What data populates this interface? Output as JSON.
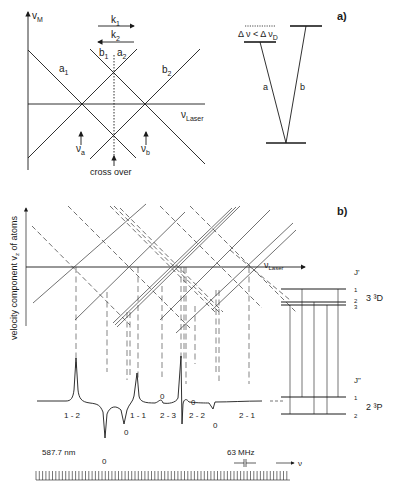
{
  "panel_a": {
    "label": "a)",
    "diagram": {
      "y_axis": "v",
      "y_axis_sub": "M",
      "x_axis": "ν",
      "x_axis_sub": "Laser",
      "beam_k1": "k",
      "beam_k1_sub": "1",
      "beam_k2": "k",
      "beam_k2_sub": "2",
      "line_a1": "a",
      "line_a1_sub": "1",
      "line_a2": "a",
      "line_a2_sub": "2",
      "line_b1": "b",
      "line_b1_sub": "1",
      "line_b2": "b",
      "line_b2_sub": "2",
      "marker_va": "ν",
      "marker_va_sub": "a",
      "marker_vb": "ν",
      "marker_vb_sub": "b",
      "crossover_label": "cross over"
    },
    "levels": {
      "condition": "Δ ν < Δ ν",
      "condition_sub": "D",
      "transition_a": "a",
      "transition_b": "b"
    }
  },
  "panel_b": {
    "label": "b)",
    "y_axis_label": "velocity component v",
    "y_axis_sub": "z",
    "y_axis_suffix": " of atoms",
    "x_axis": "ν",
    "x_axis_sub": "Laser",
    "upper_state": {
      "j_label": "J'",
      "term": "3 ³D",
      "levels": [
        "1",
        "2",
        "3"
      ]
    },
    "lower_state": {
      "j_label": "J\"",
      "term": "2 ³P",
      "levels": [
        "1",
        "2"
      ]
    },
    "spectrum": {
      "peak_labels": [
        "1 - 2",
        "1 - 1",
        "2 - 3",
        "2 - 2",
        "2 - 1"
      ],
      "crossover_zero_labels": [
        "0",
        "0",
        "0",
        "0",
        "0",
        "0"
      ],
      "wavelength": "587.7 nm",
      "scale_marker": "63 MHz",
      "freq_axis": "ν"
    }
  }
}
